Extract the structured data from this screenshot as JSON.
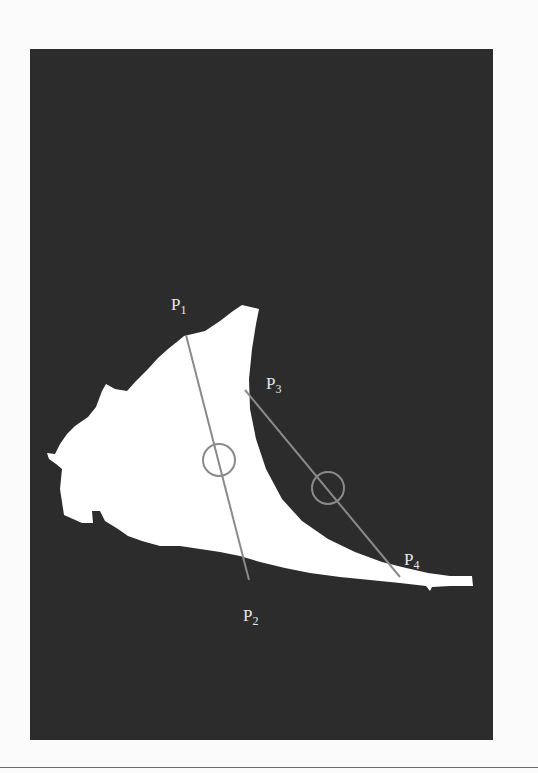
{
  "figure": {
    "colors": {
      "background": "#2c2c2c",
      "shape": "#ffffff",
      "line": "#8a8a8a",
      "label": "#e6e6e6",
      "page": "#fbfbfb"
    },
    "labels": [
      {
        "id": "P1",
        "main": "P",
        "sub": "1"
      },
      {
        "id": "P2",
        "main": "P",
        "sub": "2"
      },
      {
        "id": "P3",
        "main": "P",
        "sub": "3"
      },
      {
        "id": "P4",
        "main": "P",
        "sub": "4"
      }
    ],
    "lines": [
      {
        "from": "P1",
        "to": "P2"
      },
      {
        "from": "P3",
        "to": "P4"
      }
    ],
    "circles": [
      {
        "on_line": "P1-P2"
      },
      {
        "on_line": "P3-P4"
      }
    ]
  }
}
